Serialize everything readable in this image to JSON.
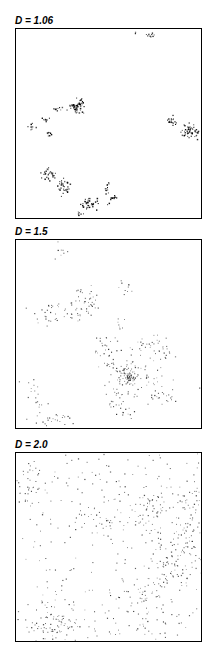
{
  "chart_data": [
    {
      "type": "scatter",
      "title": "D = 1.06",
      "xlabel": "",
      "ylabel": "",
      "grid": false,
      "legend": null,
      "description": "Highly clustered point pattern: a few tight dense clumps arranged along curved chains",
      "frame": {
        "left": 15,
        "top": 28,
        "width": 187,
        "height": 191
      },
      "point_color": "#000000",
      "point_size": 1.1,
      "clusters": [
        {
          "cx": 0.72,
          "cy": 0.03,
          "sx": 0.012,
          "sy": 0.01,
          "n": 10
        },
        {
          "cx": 0.63,
          "cy": 0.02,
          "sx": 0.004,
          "sy": 0.004,
          "n": 2
        },
        {
          "cx": 0.32,
          "cy": 0.41,
          "sx": 0.02,
          "sy": 0.018,
          "n": 45
        },
        {
          "cx": 0.34,
          "cy": 0.39,
          "sx": 0.01,
          "sy": 0.01,
          "n": 18
        },
        {
          "cx": 0.22,
          "cy": 0.42,
          "sx": 0.01,
          "sy": 0.008,
          "n": 10
        },
        {
          "cx": 0.15,
          "cy": 0.47,
          "sx": 0.01,
          "sy": 0.007,
          "n": 8
        },
        {
          "cx": 0.08,
          "cy": 0.51,
          "sx": 0.012,
          "sy": 0.01,
          "n": 8
        },
        {
          "cx": 0.17,
          "cy": 0.55,
          "sx": 0.012,
          "sy": 0.008,
          "n": 8
        },
        {
          "cx": 0.83,
          "cy": 0.48,
          "sx": 0.014,
          "sy": 0.01,
          "n": 20
        },
        {
          "cx": 0.92,
          "cy": 0.53,
          "sx": 0.02,
          "sy": 0.016,
          "n": 45
        },
        {
          "cx": 0.97,
          "cy": 0.56,
          "sx": 0.008,
          "sy": 0.012,
          "n": 8
        },
        {
          "cx": 0.18,
          "cy": 0.75,
          "sx": 0.025,
          "sy": 0.018,
          "n": 30
        },
        {
          "cx": 0.25,
          "cy": 0.82,
          "sx": 0.018,
          "sy": 0.018,
          "n": 35
        },
        {
          "cx": 0.39,
          "cy": 0.91,
          "sx": 0.022,
          "sy": 0.016,
          "n": 40
        },
        {
          "cx": 0.34,
          "cy": 0.97,
          "sx": 0.008,
          "sy": 0.01,
          "n": 6
        },
        {
          "cx": 0.49,
          "cy": 0.83,
          "sx": 0.01,
          "sy": 0.018,
          "n": 12
        },
        {
          "cx": 0.51,
          "cy": 0.89,
          "sx": 0.012,
          "sy": 0.01,
          "n": 14
        }
      ]
    },
    {
      "type": "scatter",
      "title": "D = 1.5",
      "xlabel": "",
      "ylabel": "",
      "grid": false,
      "legend": null,
      "description": "Intermediate clustering: loose branching clusters with a dense core near center-right",
      "frame": {
        "left": 15,
        "top": 239,
        "width": 187,
        "height": 190
      },
      "point_color": "#333333",
      "point_size": 0.9,
      "clusters": [
        {
          "cx": 0.24,
          "cy": 0.04,
          "sx": 0.015,
          "sy": 0.02,
          "n": 8
        },
        {
          "cx": 0.37,
          "cy": 0.32,
          "sx": 0.04,
          "sy": 0.04,
          "n": 45
        },
        {
          "cx": 0.19,
          "cy": 0.38,
          "sx": 0.05,
          "sy": 0.03,
          "n": 30
        },
        {
          "cx": 0.31,
          "cy": 0.4,
          "sx": 0.02,
          "sy": 0.015,
          "n": 8
        },
        {
          "cx": 0.59,
          "cy": 0.24,
          "sx": 0.02,
          "sy": 0.025,
          "n": 10
        },
        {
          "cx": 0.56,
          "cy": 0.46,
          "sx": 0.015,
          "sy": 0.03,
          "n": 8
        },
        {
          "cx": 0.48,
          "cy": 0.56,
          "sx": 0.035,
          "sy": 0.03,
          "n": 22
        },
        {
          "cx": 0.7,
          "cy": 0.55,
          "sx": 0.035,
          "sy": 0.03,
          "n": 22
        },
        {
          "cx": 0.78,
          "cy": 0.58,
          "sx": 0.03,
          "sy": 0.035,
          "n": 18
        },
        {
          "cx": 0.6,
          "cy": 0.7,
          "sx": 0.06,
          "sy": 0.06,
          "n": 60
        },
        {
          "cx": 0.6,
          "cy": 0.72,
          "sx": 0.022,
          "sy": 0.02,
          "n": 55
        },
        {
          "cx": 0.5,
          "cy": 0.66,
          "sx": 0.03,
          "sy": 0.02,
          "n": 12
        },
        {
          "cx": 0.74,
          "cy": 0.71,
          "sx": 0.03,
          "sy": 0.03,
          "n": 14
        },
        {
          "cx": 0.53,
          "cy": 0.82,
          "sx": 0.04,
          "sy": 0.025,
          "n": 20
        },
        {
          "cx": 0.57,
          "cy": 0.88,
          "sx": 0.025,
          "sy": 0.03,
          "n": 15
        },
        {
          "cx": 0.8,
          "cy": 0.82,
          "sx": 0.05,
          "sy": 0.03,
          "n": 22
        },
        {
          "cx": 0.12,
          "cy": 0.84,
          "sx": 0.03,
          "sy": 0.04,
          "n": 14
        },
        {
          "cx": 0.2,
          "cy": 0.94,
          "sx": 0.05,
          "sy": 0.02,
          "n": 24
        },
        {
          "cx": 0.07,
          "cy": 0.76,
          "sx": 0.03,
          "sy": 0.02,
          "n": 5
        },
        {
          "cx": 0.98,
          "cy": 0.77,
          "sx": 0.005,
          "sy": 0.01,
          "n": 2
        }
      ]
    },
    {
      "type": "scatter",
      "title": "D = 2.0",
      "xlabel": "",
      "ylabel": "",
      "grid": false,
      "legend": null,
      "description": "Space-filling pattern: broadly distributed points with mild density variation, denser on right side and bottom-left",
      "frame": {
        "left": 15,
        "top": 452,
        "width": 187,
        "height": 190
      },
      "point_color": "#3a3a3a",
      "point_size": 0.9,
      "uniform_n": 260,
      "clusters": [
        {
          "cx": 0.08,
          "cy": 0.15,
          "sx": 0.05,
          "sy": 0.07,
          "n": 40
        },
        {
          "cx": 0.4,
          "cy": 0.36,
          "sx": 0.08,
          "sy": 0.04,
          "n": 30
        },
        {
          "cx": 0.7,
          "cy": 0.3,
          "sx": 0.09,
          "sy": 0.08,
          "n": 70
        },
        {
          "cx": 0.92,
          "cy": 0.25,
          "sx": 0.05,
          "sy": 0.08,
          "n": 50
        },
        {
          "cx": 0.9,
          "cy": 0.5,
          "sx": 0.06,
          "sy": 0.09,
          "n": 70
        },
        {
          "cx": 0.8,
          "cy": 0.62,
          "sx": 0.06,
          "sy": 0.06,
          "n": 40
        },
        {
          "cx": 0.65,
          "cy": 0.73,
          "sx": 0.06,
          "sy": 0.06,
          "n": 35
        },
        {
          "cx": 0.22,
          "cy": 0.9,
          "sx": 0.07,
          "sy": 0.05,
          "n": 70
        },
        {
          "cx": 0.8,
          "cy": 0.92,
          "sx": 0.06,
          "sy": 0.04,
          "n": 20
        }
      ]
    }
  ]
}
